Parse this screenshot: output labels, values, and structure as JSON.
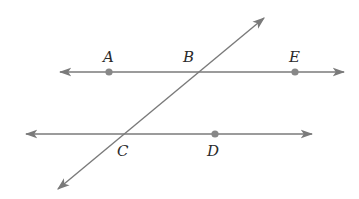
{
  "diagram": {
    "title": "",
    "colors": {
      "line": "#7a7a7a",
      "point": "#888888",
      "label": "#2a2a2a",
      "background": "#ffffff"
    },
    "lines": [
      {
        "id": "line-AE",
        "x1": 60,
        "y1": 72,
        "x2": 344,
        "y2": 72,
        "arrows": "both"
      },
      {
        "id": "line-CD",
        "x1": 26,
        "y1": 134,
        "x2": 312,
        "y2": 134,
        "arrows": "both"
      },
      {
        "id": "transversal-BC",
        "x1": 58,
        "y1": 189,
        "x2": 264,
        "y2": 18,
        "arrows": "both"
      }
    ],
    "points": [
      {
        "name": "A",
        "x": 109,
        "y": 72,
        "dot": true,
        "lx": 103,
        "ly": 62
      },
      {
        "name": "B",
        "x": 199,
        "y": 72,
        "dot": false,
        "lx": 183,
        "ly": 62
      },
      {
        "name": "E",
        "x": 295,
        "y": 72,
        "dot": true,
        "lx": 289,
        "ly": 62
      },
      {
        "name": "C",
        "x": 121,
        "y": 134,
        "dot": false,
        "lx": 117,
        "ly": 156
      },
      {
        "name": "D",
        "x": 215,
        "y": 134,
        "dot": true,
        "lx": 207,
        "ly": 156
      }
    ]
  }
}
